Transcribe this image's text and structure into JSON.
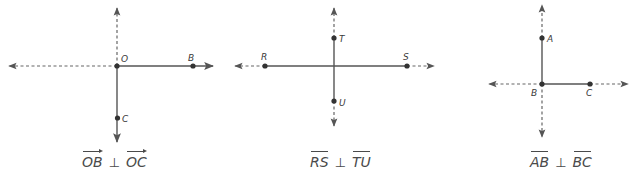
{
  "colors": {
    "line": "#555555",
    "point": "#333333",
    "text": "#4a4a4a",
    "background": "#ffffff"
  },
  "diagrams": [
    {
      "id": "rays",
      "points": {
        "O": {
          "label": "O"
        },
        "B": {
          "label": "B"
        },
        "C": {
          "label": "C"
        }
      },
      "caption": {
        "left": "OB",
        "symbol": "⊥",
        "right": "OC",
        "notation": "ray"
      }
    },
    {
      "id": "segments-cross",
      "points": {
        "R": {
          "label": "R"
        },
        "S": {
          "label": "S"
        },
        "T": {
          "label": "T"
        },
        "U": {
          "label": "U"
        }
      },
      "caption": {
        "left": "RS",
        "symbol": "⊥",
        "right": "TU",
        "notation": "segment"
      }
    },
    {
      "id": "segments-corner",
      "points": {
        "A": {
          "label": "A"
        },
        "B": {
          "label": "B"
        },
        "C": {
          "label": "C"
        }
      },
      "caption": {
        "left": "AB",
        "symbol": "⊥",
        "right": "BC",
        "notation": "segment"
      }
    }
  ]
}
